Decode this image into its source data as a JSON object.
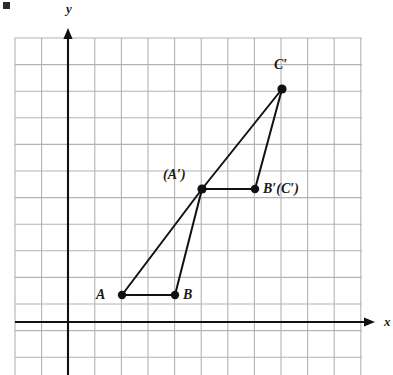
{
  "figure": {
    "kind": "coordinate-grid-geometry-diagram",
    "background_color": "#ffffff",
    "grid": {
      "line_color": "#b3b3b3",
      "cell_size_px": 26.6,
      "left_px": 15,
      "top_px": 38,
      "right_px": 362,
      "bottom_px": 375,
      "cols": 13,
      "rows": 13,
      "visible": true
    },
    "axes": {
      "color": "#111111",
      "x_axis": {
        "label": "x",
        "label_x_px": 384,
        "label_y_px": 315,
        "y_px": 322,
        "start_px": 15,
        "end_px": 375,
        "arrow": "right"
      },
      "y_axis": {
        "label": "y",
        "label_x_px": 66,
        "label_y_px": 2,
        "x_px": 68,
        "start_px": 375,
        "end_px": 28,
        "arrow": "up"
      },
      "origin_px": {
        "x": 68,
        "y": 322
      }
    },
    "stroke_color": "#111111",
    "points": [
      {
        "name": "A",
        "label": "A",
        "x_px": 122,
        "y_px": 295,
        "grid": [
          2,
          1
        ],
        "label_x_px": 96,
        "label_y_px": 288,
        "dot_r": 4.2
      },
      {
        "name": "B",
        "label": "B",
        "x_px": 175,
        "y_px": 295,
        "grid": [
          4,
          1
        ],
        "label_x_px": 183,
        "label_y_px": 288,
        "dot_r": 4.2
      },
      {
        "name": "A-prime",
        "label": "(A′)",
        "x_px": 202,
        "y_px": 189,
        "grid": [
          5,
          5
        ],
        "label_x_px": 163,
        "label_y_px": 168,
        "dot_r": 4.6
      },
      {
        "name": "B-prime-C-prime",
        "label": "B′(C′)",
        "x_px": 255,
        "y_px": 189,
        "grid": [
          7,
          5
        ],
        "label_x_px": 263,
        "label_y_px": 182,
        "dot_r": 4.2
      },
      {
        "name": "C-prime",
        "label": "C′",
        "x_px": 282,
        "y_px": 89,
        "grid": [
          8,
          8.75
        ],
        "label_x_px": 274,
        "label_y_px": 58,
        "dot_r": 4.6
      }
    ],
    "segments": [
      {
        "name": "segment-A-B",
        "from": "A",
        "to": "B",
        "x1": 122,
        "y1": 295,
        "x2": 175,
        "y2": 295,
        "width": 2.0
      },
      {
        "name": "segment-A-Aprime",
        "from": "A",
        "to": "A-prime",
        "x1": 122,
        "y1": 295,
        "x2": 202,
        "y2": 189,
        "width": 2.0
      },
      {
        "name": "segment-B-Aprime",
        "from": "B",
        "to": "A-prime",
        "x1": 175,
        "y1": 295,
        "x2": 202,
        "y2": 189,
        "width": 2.0
      },
      {
        "name": "segment-Aprime-Bprime",
        "from": "A-prime",
        "to": "B-prime-C-prime",
        "x1": 202,
        "y1": 189,
        "x2": 255,
        "y2": 189,
        "width": 2.0
      },
      {
        "name": "segment-Aprime-Cprime",
        "from": "A-prime",
        "to": "C-prime",
        "x1": 202,
        "y1": 189,
        "x2": 282,
        "y2": 89,
        "width": 2.0
      },
      {
        "name": "segment-Bprime-Cprime",
        "from": "B-prime-C-prime",
        "to": "C-prime",
        "x1": 255,
        "y1": 189,
        "x2": 282,
        "y2": 89,
        "width": 2.0
      }
    ],
    "corner_mark": {
      "present": true,
      "color": "#2b2b2b"
    }
  }
}
